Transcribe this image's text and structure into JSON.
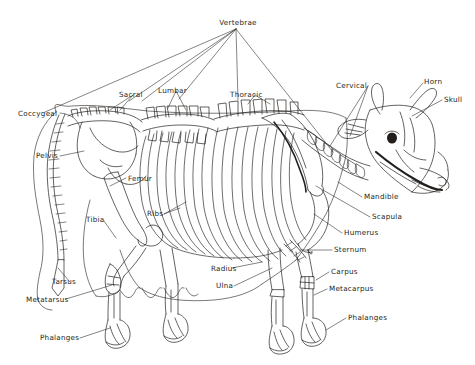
{
  "diagram": {
    "title": "Vertebrae",
    "ink_color": "#221f1d",
    "background_color": "#ffffff",
    "labels": [
      {
        "id": "vertebrae",
        "text": "Vertebrae",
        "x": 238,
        "y": 22,
        "align": "ctr"
      },
      {
        "id": "coccygeal",
        "text": "Coccygeal",
        "x": 18,
        "y": 113,
        "align": "left"
      },
      {
        "id": "sacral",
        "text": "Sacral",
        "x": 119,
        "y": 94,
        "align": "left"
      },
      {
        "id": "lumbar",
        "text": "Lumbar",
        "x": 158,
        "y": 90,
        "align": "left"
      },
      {
        "id": "thoracic",
        "text": "Thoracic",
        "x": 230,
        "y": 94,
        "align": "left"
      },
      {
        "id": "cervical",
        "text": "Cervical",
        "x": 336,
        "y": 85,
        "align": "left"
      },
      {
        "id": "horn",
        "text": "Horn",
        "x": 424,
        "y": 81,
        "align": "left"
      },
      {
        "id": "skull",
        "text": "Skull",
        "x": 444,
        "y": 99,
        "align": "left"
      },
      {
        "id": "pelvis",
        "text": "Pelvis",
        "x": 36,
        "y": 155,
        "align": "left"
      },
      {
        "id": "femur",
        "text": "Femur",
        "x": 128,
        "y": 178,
        "align": "left"
      },
      {
        "id": "ribs",
        "text": "Ribs",
        "x": 147,
        "y": 213,
        "align": "left"
      },
      {
        "id": "tibia",
        "text": "Tibia",
        "x": 86,
        "y": 219,
        "align": "left"
      },
      {
        "id": "mandible",
        "text": "Mandible",
        "x": 364,
        "y": 196,
        "align": "left"
      },
      {
        "id": "scapula",
        "text": "Scapula",
        "x": 372,
        "y": 216,
        "align": "left"
      },
      {
        "id": "humerus",
        "text": "Humerus",
        "x": 344,
        "y": 232,
        "align": "left"
      },
      {
        "id": "sternum",
        "text": "Sternum",
        "x": 334,
        "y": 249,
        "align": "left"
      },
      {
        "id": "radius",
        "text": "Radius",
        "x": 211,
        "y": 268,
        "align": "left"
      },
      {
        "id": "ulna",
        "text": "Ulna",
        "x": 216,
        "y": 285,
        "align": "left"
      },
      {
        "id": "carpus",
        "text": "Carpus",
        "x": 331,
        "y": 271,
        "align": "left"
      },
      {
        "id": "metacarpus",
        "text": "Metacarpus",
        "x": 329,
        "y": 288,
        "align": "left"
      },
      {
        "id": "phalanges-front",
        "text": "Phalanges",
        "x": 348,
        "y": 317,
        "align": "left"
      },
      {
        "id": "tarsus",
        "text": "Tarsus",
        "x": 52,
        "y": 281,
        "align": "left"
      },
      {
        "id": "metatarsus",
        "text": "Metatarsus",
        "x": 26,
        "y": 299,
        "align": "left"
      },
      {
        "id": "phalanges-hind",
        "text": "Phalanges",
        "x": 40,
        "y": 337,
        "align": "left"
      }
    ]
  }
}
